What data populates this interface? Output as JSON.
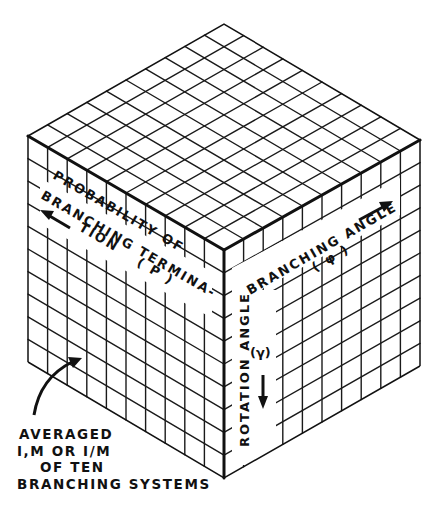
{
  "diagram": {
    "type": "isometric-cube-grid",
    "grid_divisions": 10,
    "colors": {
      "line": "#111111",
      "background": "#ffffff"
    },
    "vertices": {
      "top": [
        224,
        24
      ],
      "left": [
        28,
        136
      ],
      "right": [
        420,
        140
      ],
      "front": [
        224,
        250
      ],
      "bottom_left": [
        28,
        362
      ],
      "bottom_right": [
        420,
        366
      ],
      "bottom": [
        224,
        478
      ]
    }
  },
  "labels": {
    "left_face": {
      "line1": "PROBABILITY OF",
      "line2": "BRANCHING TERMINA-",
      "line3": "TION",
      "symbol": "( P )",
      "arrow": "arrow-left-up"
    },
    "right_face_top": {
      "line1": "BRANCHING ANGLE",
      "symbol": "( φ )",
      "arrow": "arrow-right-up"
    },
    "right_face_vertical": {
      "line1": "ROTATION ANGLE",
      "symbol": "(γ)",
      "arrow": "arrow-down"
    }
  },
  "caption": {
    "lines": [
      "AVERAGED",
      "I,M OR I/M",
      "OF TEN",
      "BRANCHING SYSTEMS"
    ],
    "arrow": "curved-arrow-up-right"
  }
}
